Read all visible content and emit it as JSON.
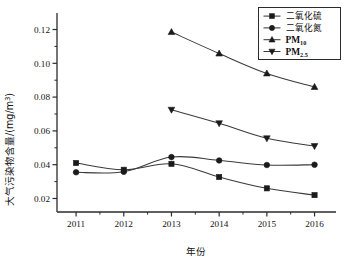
{
  "chart_data": {
    "type": "line",
    "title": "",
    "xlabel": "年份",
    "ylabel": "大气污染物含量/(mg/m³)",
    "ylabel_main": "大气污染物含量/(mg/m",
    "ylabel_sup": "3",
    "ylabel_tail": ")",
    "categories": [
      2011,
      2012,
      2013,
      2014,
      2015,
      2016
    ],
    "x": [
      2011,
      2012,
      2013,
      2014,
      2015,
      2016
    ],
    "xlim": [
      2010.6,
      2016.45
    ],
    "ylim": [
      0.012,
      0.128
    ],
    "yticks": [
      0.02,
      0.04,
      0.06,
      0.08,
      0.1,
      0.12
    ],
    "ytick_labels": [
      "0.02",
      "0.04",
      "0.06",
      "0.08",
      "0.10",
      "0.12"
    ],
    "yminor_ticks": [
      0.03,
      0.05,
      0.07,
      0.09,
      0.11
    ],
    "xtick_labels": [
      "2011",
      "2012",
      "2013",
      "2014",
      "2015",
      "2016"
    ],
    "grid": false,
    "legend_position": "top-right",
    "series": [
      {
        "name": "二氧化硫",
        "marker": "square",
        "x": [
          2011,
          2012,
          2013,
          2014,
          2015,
          2016
        ],
        "values": [
          0.041,
          0.037,
          0.0405,
          0.0327,
          0.026,
          0.022
        ]
      },
      {
        "name": "二氧化氮",
        "marker": "circle",
        "x": [
          2011,
          2012,
          2013,
          2014,
          2015,
          2016
        ],
        "values": [
          0.0355,
          0.0358,
          0.0445,
          0.0425,
          0.0398,
          0.04
        ]
      },
      {
        "name": "PM10",
        "name_main": "PM",
        "name_sub": "10",
        "marker": "triangle-up",
        "x": [
          2013,
          2014,
          2015,
          2016
        ],
        "values": [
          0.1185,
          0.1058,
          0.094,
          0.086
        ]
      },
      {
        "name": "PM2.5",
        "name_main": "PM",
        "name_sub": "2.5",
        "marker": "triangle-down",
        "x": [
          2013,
          2014,
          2015,
          2016
        ],
        "values": [
          0.0725,
          0.0645,
          0.0556,
          0.051
        ]
      }
    ]
  },
  "colors": {
    "axis": "#2b2b2b",
    "line": "#3a3a3a",
    "marker": "#1b1b1b",
    "background": "#ffffff"
  }
}
